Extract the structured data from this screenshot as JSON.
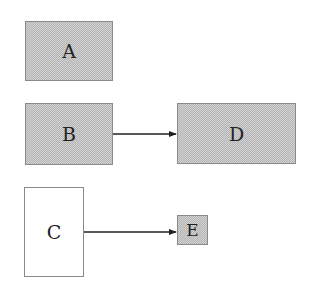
{
  "diagram": {
    "nodes": [
      {
        "id": "A",
        "label": "A",
        "style": "shaded"
      },
      {
        "id": "B",
        "label": "B",
        "style": "shaded"
      },
      {
        "id": "C",
        "label": "C",
        "style": "plain"
      },
      {
        "id": "D",
        "label": "D",
        "style": "shaded"
      },
      {
        "id": "E",
        "label": "E",
        "style": "shaded"
      }
    ],
    "edges": [
      {
        "from": "B",
        "to": "D"
      },
      {
        "from": "C",
        "to": "E"
      }
    ],
    "colors": {
      "border": "#8a8a8a",
      "fill": "#c8c8c8",
      "arrow": "#222222",
      "text": "#222222"
    }
  }
}
